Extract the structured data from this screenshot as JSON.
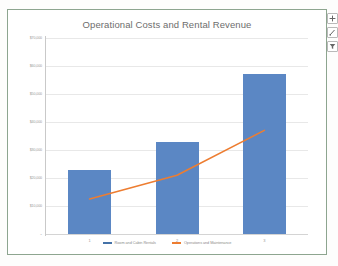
{
  "chart": {
    "title": "Operational Costs and Rental Revenue",
    "frame_color": "#8da58f",
    "plot_background": "#ffffff"
  },
  "controls": [
    {
      "name": "chart-elements-button",
      "icon": "plus-icon",
      "label": "+"
    },
    {
      "name": "chart-styles-button",
      "icon": "brush-icon",
      "label": ""
    },
    {
      "name": "chart-filters-button",
      "icon": "funnel-icon",
      "label": ""
    }
  ],
  "legend": [
    {
      "label": "Room and Cabin Rentals",
      "color": "#4472a8",
      "marker": "bar"
    },
    {
      "label": "Operations and Maintenance",
      "color": "#ed7d31",
      "marker": "line"
    }
  ],
  "chart_data": {
    "type": "bar",
    "title": "Operational Costs and Rental Revenue",
    "xlabel": "",
    "ylabel": "",
    "categories": [
      "1",
      "2",
      "3"
    ],
    "ytick_labels": [
      "$70,000",
      "$60,000",
      "$50,000",
      "$40,000",
      "$30,000",
      "$20,000",
      "$10,000",
      "-"
    ],
    "ytick_values": [
      70000,
      60000,
      50000,
      40000,
      30000,
      20000,
      10000,
      0
    ],
    "ylim": [
      0,
      70000
    ],
    "grid": true,
    "legend_position": "bottom",
    "series": [
      {
        "name": "Room and Cabin Rentals",
        "type": "bar",
        "color": "#5b87c4",
        "values": [
          23000,
          33000,
          57000
        ]
      },
      {
        "name": "Operations and Maintenance",
        "type": "line",
        "color": "#ed7d31",
        "values": [
          12500,
          21000,
          37000
        ]
      }
    ]
  }
}
